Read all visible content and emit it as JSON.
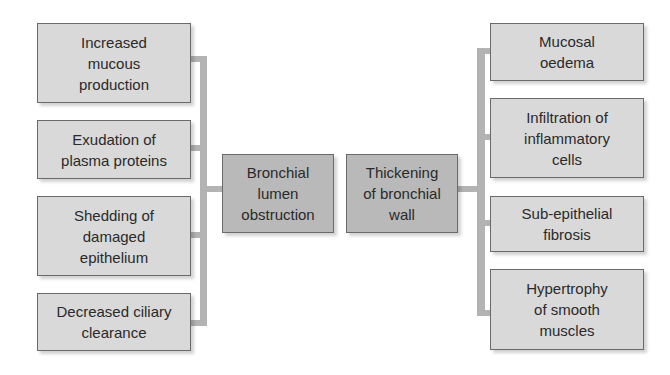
{
  "diagram": {
    "center": {
      "left": {
        "label": "Bronchial lumen obstruction",
        "lines": [
          "Bronchial",
          "lumen",
          "obstruction"
        ]
      },
      "right": {
        "label": "Thickening of bronchial wall",
        "lines": [
          "Thickening",
          "of bronchial",
          "wall"
        ]
      }
    },
    "left_causes": [
      {
        "lines": [
          "Increased",
          "mucous",
          "production"
        ]
      },
      {
        "lines": [
          "Exudation of",
          "plasma proteins"
        ]
      },
      {
        "lines": [
          "Shedding of",
          "damaged",
          "epithelium"
        ]
      },
      {
        "lines": [
          "Decreased ciliary",
          "clearance"
        ]
      }
    ],
    "right_causes": [
      {
        "lines": [
          "Mucosal",
          "oedema"
        ]
      },
      {
        "lines": [
          "Infiltration of",
          "inflammatory",
          "cells"
        ]
      },
      {
        "lines": [
          "Sub-epithelial",
          "fibrosis"
        ]
      },
      {
        "lines": [
          "Hypertrophy",
          "of smooth",
          "muscles"
        ]
      }
    ],
    "colors": {
      "cause_box": "#d9d9d9",
      "center_box": "#b9b9b9",
      "connector": "#b3b3b3",
      "border": "#6a6a6a"
    }
  }
}
